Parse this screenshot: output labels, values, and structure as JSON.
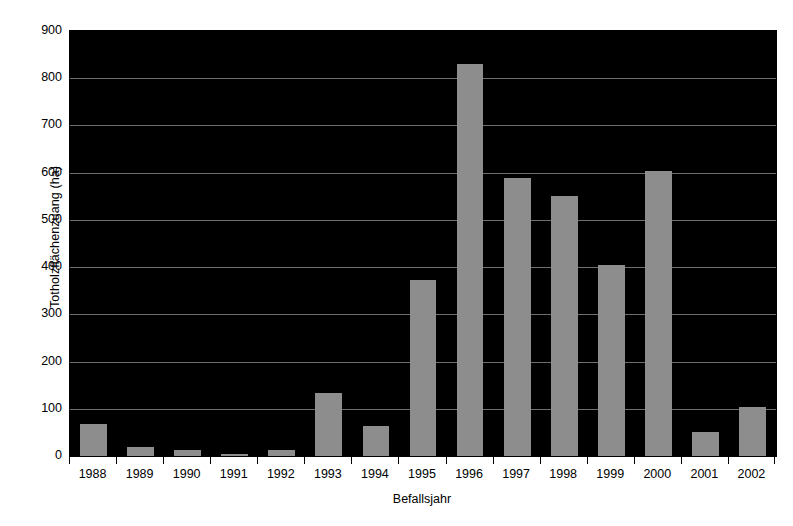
{
  "chart_data": {
    "type": "bar",
    "title": "",
    "xlabel": "Befallsjahr",
    "ylabel": "Totholzflächenzuang (ha)",
    "categories": [
      "1988",
      "1989",
      "1990",
      "1991",
      "1992",
      "1993",
      "1994",
      "1995",
      "1996",
      "1997",
      "1998",
      "1999",
      "2000",
      "2001",
      "2002"
    ],
    "values": [
      68,
      20,
      12,
      4,
      12,
      133,
      63,
      372,
      830,
      588,
      551,
      404,
      603,
      51,
      104
    ],
    "ylim": [
      0,
      900
    ],
    "ytick_labels": [
      "0",
      "100",
      "200",
      "300",
      "400",
      "500",
      "600",
      "700",
      "800",
      "900"
    ],
    "ytick_values": [
      0,
      100,
      200,
      300,
      400,
      500,
      600,
      700,
      800,
      900
    ],
    "grid": "horizontal",
    "legend": "none",
    "colors": {
      "bar_fill": "#8d8d8d",
      "plot_background": "#000000",
      "gridline": "#6e6e6e",
      "axis": "#000000",
      "page_background": "#ffffff",
      "text": "#000000"
    }
  }
}
